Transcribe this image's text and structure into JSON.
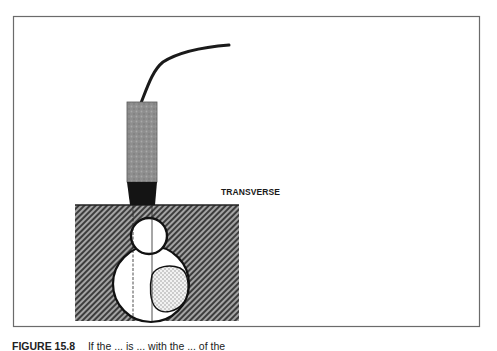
{
  "diagram": {
    "label": "TRANSVERSE",
    "colors": {
      "frame": "#6b6b6b",
      "material_hatch_dark": "#3a3a3a",
      "material_hatch_light": "#9a9a9a",
      "transducer_body": "#8c8c8c",
      "transducer_tip": "#141414",
      "cable": "#1a1a1a",
      "void_fill": "#ffffff",
      "inclusion_speckle": "#c8c8c8"
    },
    "panels": [
      {
        "name": "left",
        "description": "Transducer on flat surface above a round void and a large void containing a speckled inclusion"
      },
      {
        "name": "right",
        "description": "Transducer pressed into indented surface above a round void and a speckled teardrop inclusion with a crack tail"
      }
    ]
  },
  "caption": {
    "figure_number": "FIGURE 15.8",
    "text": "If the ... is ... with the ... of the"
  }
}
